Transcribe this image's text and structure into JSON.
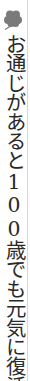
{
  "column": {
    "icon": "four-leaf-clover-icon",
    "headline": "お通じがあると100歳でも元気に復活",
    "colors": {
      "text": "#2a2a2a",
      "icon": "#7a7a7a",
      "rule": "#d8d8d8",
      "background": "#ffffff"
    }
  }
}
